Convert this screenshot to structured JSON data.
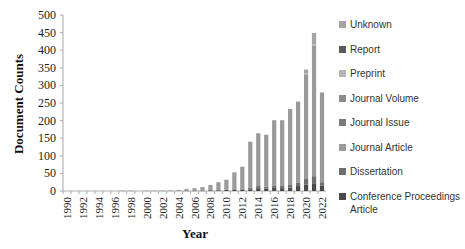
{
  "chart_data": {
    "type": "bar",
    "stacked": true,
    "title": "",
    "xlabel": "Year",
    "ylabel": "Document Counts",
    "ylim": [
      0,
      500
    ],
    "yticks": [
      0,
      50,
      100,
      150,
      200,
      250,
      300,
      350,
      400,
      450,
      500
    ],
    "categories": [
      "1990",
      "1991",
      "1992",
      "1993",
      "1994",
      "1995",
      "1996",
      "1997",
      "1998",
      "1999",
      "2000",
      "2001",
      "2002",
      "2003",
      "2004",
      "2005",
      "2006",
      "2007",
      "2008",
      "2009",
      "2010",
      "2011",
      "2012",
      "2013",
      "2014",
      "2015",
      "2016",
      "2017",
      "2018",
      "2019",
      "2020",
      "2021",
      "2022"
    ],
    "xtick_labels": [
      "1990",
      "1992",
      "1994",
      "1996",
      "1998",
      "2000",
      "2002",
      "2004",
      "2006",
      "2008",
      "2010",
      "2012",
      "2014",
      "2016",
      "2018",
      "2020",
      "2022"
    ],
    "grid": false,
    "legend_position": "right",
    "series": [
      {
        "name": "Conference Proceedings Article",
        "color": "#4a4a4a",
        "values": [
          0,
          0,
          0,
          0,
          0,
          0,
          0,
          0,
          0,
          0,
          0,
          0,
          0,
          0,
          0,
          1,
          1,
          1,
          2,
          2,
          3,
          3,
          4,
          5,
          8,
          7,
          9,
          8,
          10,
          14,
          18,
          22,
          15
        ]
      },
      {
        "name": "Dissertation",
        "color": "#6e6e6e",
        "values": [
          0,
          0,
          0,
          0,
          0,
          0,
          0,
          0,
          0,
          0,
          0,
          0,
          0,
          0,
          0,
          0,
          0,
          0,
          1,
          1,
          1,
          2,
          3,
          4,
          6,
          5,
          7,
          6,
          9,
          10,
          16,
          20,
          10
        ]
      },
      {
        "name": "Journal Article",
        "color": "#9a9a9a",
        "values": [
          0,
          0,
          0,
          0,
          0,
          0,
          0,
          1,
          1,
          0,
          1,
          1,
          1,
          2,
          3,
          5,
          7,
          10,
          14,
          22,
          28,
          48,
          62,
          131,
          150,
          148,
          185,
          187,
          214,
          230,
          296,
          370,
          255
        ]
      },
      {
        "name": "Journal Issue",
        "color": "#7a7a7a",
        "values": [
          0,
          0,
          0,
          0,
          0,
          0,
          0,
          0,
          0,
          0,
          0,
          0,
          0,
          0,
          0,
          0,
          0,
          0,
          0,
          0,
          0,
          0,
          0,
          0,
          0,
          0,
          0,
          0,
          0,
          0,
          0,
          0,
          0
        ]
      },
      {
        "name": "Journal Volume",
        "color": "#8c8c8c",
        "values": [
          0,
          0,
          0,
          0,
          0,
          0,
          0,
          0,
          0,
          0,
          0,
          0,
          0,
          0,
          0,
          0,
          0,
          0,
          0,
          0,
          0,
          0,
          0,
          0,
          0,
          0,
          0,
          0,
          0,
          0,
          0,
          0,
          0
        ]
      },
      {
        "name": "Preprint",
        "color": "#b4b4b4",
        "values": [
          0,
          0,
          0,
          0,
          0,
          0,
          0,
          0,
          0,
          0,
          0,
          0,
          0,
          0,
          0,
          0,
          0,
          0,
          0,
          0,
          0,
          0,
          0,
          0,
          0,
          0,
          0,
          0,
          0,
          0,
          5,
          4,
          0
        ]
      },
      {
        "name": "Report",
        "color": "#5a5a5a",
        "values": [
          0,
          0,
          0,
          0,
          0,
          0,
          0,
          0,
          0,
          0,
          0,
          0,
          0,
          0,
          0,
          0,
          0,
          0,
          0,
          0,
          0,
          0,
          0,
          0,
          0,
          0,
          0,
          0,
          0,
          0,
          0,
          0,
          0
        ]
      },
      {
        "name": "Unknown",
        "color": "#a4a4a4",
        "values": [
          0,
          0,
          0,
          0,
          0,
          0,
          0,
          0,
          0,
          0,
          0,
          0,
          0,
          0,
          0,
          0,
          0,
          0,
          0,
          0,
          0,
          0,
          0,
          0,
          0,
          0,
          0,
          0,
          0,
          0,
          10,
          33,
          0
        ]
      }
    ],
    "totals": [
      0,
      0,
      0,
      0,
      0,
      0,
      0,
      1,
      1,
      0,
      1,
      1,
      1,
      2,
      3,
      6,
      8,
      11,
      17,
      25,
      32,
      53,
      69,
      140,
      164,
      160,
      201,
      201,
      233,
      254,
      345,
      449,
      280
    ]
  },
  "legend": {
    "items": [
      {
        "label": "Unknown",
        "color": "#a4a4a4"
      },
      {
        "label": "Report",
        "color": "#5a5a5a"
      },
      {
        "label": "Preprint",
        "color": "#b4b4b4"
      },
      {
        "label": "Journal Volume",
        "color": "#8c8c8c"
      },
      {
        "label": "Journal Issue",
        "color": "#7a7a7a"
      },
      {
        "label": "Journal Article",
        "color": "#9a9a9a"
      },
      {
        "label": "Dissertation",
        "color": "#6e6e6e"
      },
      {
        "label": "Conference Proceedings Article",
        "color": "#4a4a4a"
      }
    ]
  }
}
